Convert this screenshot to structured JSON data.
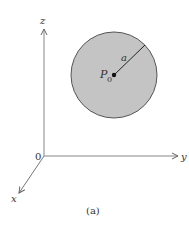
{
  "figure": {
    "caption": "(a)",
    "axes": {
      "z_label": "z",
      "y_label": "y",
      "x_label": "x",
      "origin_label": "0"
    },
    "sphere": {
      "center_label": "P",
      "center_subscript": "0",
      "radius_label": "a",
      "fill_color": "#c4c4c4",
      "stroke_color": "#555555"
    }
  }
}
